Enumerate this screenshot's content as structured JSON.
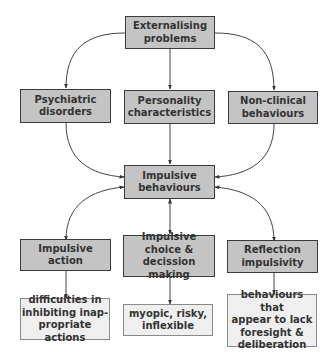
{
  "diagram": {
    "title": "",
    "nodes": [
      {
        "id": "externalising",
        "label": "Externalising\nproblems",
        "style": "dark"
      },
      {
        "id": "psychiatric",
        "label": "Psychiatric\ndisorders",
        "style": "dark"
      },
      {
        "id": "personality",
        "label": "Personality\ncharacteristics",
        "style": "dark"
      },
      {
        "id": "nonclinical",
        "label": "Non-clinical\nbehaviours",
        "style": "dark"
      },
      {
        "id": "impulsive_behaviours",
        "label": "Impulsive\nbehaviours",
        "style": "dark"
      },
      {
        "id": "impulsive_action",
        "label": "Impulsive action",
        "style": "dark"
      },
      {
        "id": "impulsive_choice",
        "label": "Impulsive\nchoice &\ndecission making",
        "style": "dark"
      },
      {
        "id": "reflection",
        "label": "Reflection\nimpulsivity",
        "style": "dark"
      },
      {
        "id": "desc_action",
        "label": "difficulties in\ninhibiting inap-\npropriate actions",
        "style": "light"
      },
      {
        "id": "desc_choice",
        "label": "myopic, risky,\ninflexible",
        "style": "light"
      },
      {
        "id": "desc_reflection",
        "label": "behaviours that\nappear to lack\nforesight &\ndeliberation",
        "style": "light"
      }
    ],
    "edges": [
      {
        "from": "externalising",
        "to": "psychiatric",
        "type": "arrow"
      },
      {
        "from": "externalising",
        "to": "personality",
        "type": "arrow"
      },
      {
        "from": "externalising",
        "to": "nonclinical",
        "type": "arrow"
      },
      {
        "from": "psychiatric",
        "to": "impulsive_behaviours",
        "type": "arrow"
      },
      {
        "from": "personality",
        "to": "impulsive_behaviours",
        "type": "arrow"
      },
      {
        "from": "nonclinical",
        "to": "impulsive_behaviours",
        "type": "arrow"
      },
      {
        "from": "impulsive_behaviours",
        "to": "impulsive_action",
        "type": "bidirectional"
      },
      {
        "from": "impulsive_behaviours",
        "to": "impulsive_choice",
        "type": "bidirectional"
      },
      {
        "from": "impulsive_behaviours",
        "to": "reflection",
        "type": "bidirectional"
      },
      {
        "from": "impulsive_action",
        "to": "desc_action",
        "type": "arrow"
      },
      {
        "from": "impulsive_choice",
        "to": "desc_choice",
        "type": "arrow"
      },
      {
        "from": "reflection",
        "to": "desc_reflection",
        "type": "arrow"
      }
    ]
  },
  "colors": {
    "dark_fill": "#c4c4c4",
    "light_fill": "#efefef",
    "stroke": "#3a3a3a",
    "text": "#333333"
  }
}
